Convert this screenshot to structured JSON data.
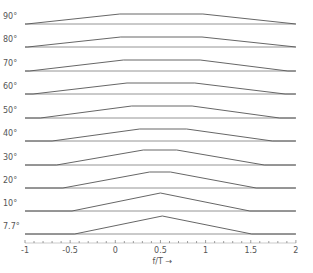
{
  "chart_data": {
    "type": "line",
    "title": "",
    "xlabel": "f/T →",
    "ylabel": "",
    "xlim": [
      -1,
      2
    ],
    "x_ticks": [
      -1,
      -0.5,
      0,
      0.5,
      1,
      1.5,
      2
    ],
    "x_tick_labels": [
      "-1",
      "-0.5",
      "0",
      "0.5",
      "1",
      "1.5",
      "2"
    ],
    "minor_tick_step": 0.1,
    "grid": false,
    "legend": null,
    "series": [
      {
        "name": "90°",
        "points": [
          [
            -1.0,
            0
          ],
          [
            -0.98,
            0
          ],
          [
            0.05,
            1
          ],
          [
            0.97,
            1
          ],
          [
            2.0,
            0
          ]
        ]
      },
      {
        "name": "80°",
        "points": [
          [
            -1.0,
            0
          ],
          [
            -0.97,
            0
          ],
          [
            0.06,
            1
          ],
          [
            0.96,
            1
          ],
          [
            2.0,
            0
          ]
        ]
      },
      {
        "name": "70°",
        "points": [
          [
            -1.0,
            0
          ],
          [
            -0.95,
            0
          ],
          [
            0.09,
            1
          ],
          [
            0.94,
            1
          ],
          [
            1.91,
            0
          ],
          [
            2.0,
            0
          ]
        ]
      },
      {
        "name": "60°",
        "points": [
          [
            -1.0,
            0
          ],
          [
            -0.91,
            0
          ],
          [
            0.13,
            1
          ],
          [
            0.88,
            1
          ],
          [
            1.88,
            0
          ],
          [
            2.0,
            0
          ]
        ]
      },
      {
        "name": "50°",
        "points": [
          [
            -1.0,
            0
          ],
          [
            -0.83,
            0
          ],
          [
            0.18,
            1
          ],
          [
            0.85,
            1
          ],
          [
            1.82,
            0
          ],
          [
            2.0,
            0
          ]
        ]
      },
      {
        "name": "40°",
        "points": [
          [
            -1.0,
            0
          ],
          [
            -0.7,
            0
          ],
          [
            0.27,
            1
          ],
          [
            0.79,
            1
          ],
          [
            1.74,
            0
          ],
          [
            2.0,
            0
          ]
        ]
      },
      {
        "name": "30°",
        "points": [
          [
            -1.0,
            0
          ],
          [
            -0.65,
            0
          ],
          [
            0.31,
            1
          ],
          [
            0.68,
            1
          ],
          [
            1.65,
            0
          ],
          [
            2.0,
            0
          ]
        ]
      },
      {
        "name": "20°",
        "points": [
          [
            -1.0,
            0
          ],
          [
            -0.58,
            0
          ],
          [
            0.38,
            1
          ],
          [
            0.61,
            1
          ],
          [
            1.56,
            0
          ],
          [
            2.0,
            0
          ]
        ]
      },
      {
        "name": "10°",
        "points": [
          [
            -1.0,
            0
          ],
          [
            -0.48,
            0
          ],
          [
            0.5,
            1
          ],
          [
            1.49,
            0
          ],
          [
            2.0,
            0
          ]
        ]
      },
      {
        "name": "7.7°",
        "points": [
          [
            -1.0,
            0
          ],
          [
            -0.45,
            0
          ],
          [
            0.52,
            1
          ],
          [
            1.51,
            0
          ],
          [
            2.0,
            0
          ]
        ]
      }
    ]
  },
  "layout": {
    "x_px_at_minus1": 25,
    "px_per_unit": 90.3,
    "baselines_px": [
      24,
      47,
      71,
      94,
      118,
      141,
      165,
      188,
      211,
      234
    ],
    "peak_heights_px": [
      10,
      10,
      11,
      11,
      12,
      12,
      15,
      16,
      18,
      18
    ],
    "axis_y_px": 243,
    "line_color": "#555555"
  }
}
